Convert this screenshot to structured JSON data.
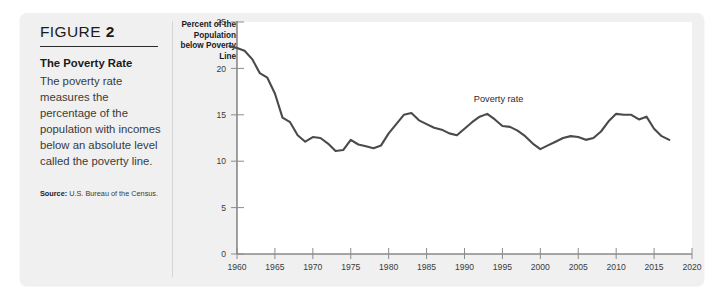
{
  "figure": {
    "label_prefix": "FIGURE",
    "label_number": "2",
    "title": "The Poverty Rate",
    "body": "The poverty rate measures the percentage of the population with incomes below an absolute level called the poverty line.",
    "source_label": "Source:",
    "source_text": "U.S. Bureau of the Census."
  },
  "chart_data": {
    "type": "line",
    "title": "",
    "xlabel": "",
    "ylabel": "Percent of the Population below Poverty Line",
    "ylabel_lines": [
      "Percent of the",
      "Population",
      "below Poverty",
      "Line"
    ],
    "xlim": [
      1960,
      2020
    ],
    "ylim": [
      0,
      25
    ],
    "grid": false,
    "legend_position": "inline-annotation",
    "xticks": [
      1960,
      1965,
      1970,
      1975,
      1980,
      1985,
      1990,
      1995,
      2000,
      2005,
      2010,
      2015,
      2020
    ],
    "yticks": [
      0,
      5,
      10,
      15,
      20,
      25
    ],
    "annotations": [
      {
        "text": "Poverty rate",
        "x": 1994.5,
        "y": 16.4
      }
    ],
    "series": [
      {
        "name": "Poverty rate",
        "color": "#4a4a4a",
        "x": [
          1959,
          1960,
          1961,
          1962,
          1963,
          1964,
          1965,
          1966,
          1967,
          1968,
          1969,
          1970,
          1971,
          1972,
          1973,
          1974,
          1975,
          1976,
          1977,
          1978,
          1979,
          1980,
          1981,
          1982,
          1983,
          1984,
          1985,
          1986,
          1987,
          1988,
          1989,
          1990,
          1991,
          1992,
          1993,
          1994,
          1995,
          1996,
          1997,
          1998,
          1999,
          2000,
          2001,
          2002,
          2003,
          2004,
          2005,
          2006,
          2007,
          2008,
          2009,
          2010,
          2011,
          2012,
          2013,
          2014,
          2015,
          2016,
          2017
        ],
        "values": [
          22.4,
          22.2,
          21.9,
          21.0,
          19.5,
          19.0,
          17.3,
          14.7,
          14.2,
          12.8,
          12.1,
          12.6,
          12.5,
          11.9,
          11.1,
          11.2,
          12.3,
          11.8,
          11.6,
          11.4,
          11.7,
          13.0,
          14.0,
          15.0,
          15.2,
          14.4,
          14.0,
          13.6,
          13.4,
          13.0,
          12.8,
          13.5,
          14.2,
          14.8,
          15.1,
          14.5,
          13.8,
          13.7,
          13.3,
          12.7,
          11.9,
          11.3,
          11.7,
          12.1,
          12.5,
          12.7,
          12.6,
          12.3,
          12.5,
          13.2,
          14.3,
          15.1,
          15.0,
          15.0,
          14.5,
          14.8,
          13.5,
          12.7,
          12.3
        ]
      }
    ]
  }
}
